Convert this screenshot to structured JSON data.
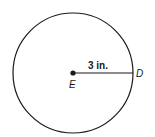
{
  "diagram": {
    "type": "circle-with-radius",
    "center_label": "E",
    "point_label": "D",
    "radius_label": "3 in.",
    "colors": {
      "stroke": "#1a1a1a",
      "background": "#ffffff"
    }
  }
}
